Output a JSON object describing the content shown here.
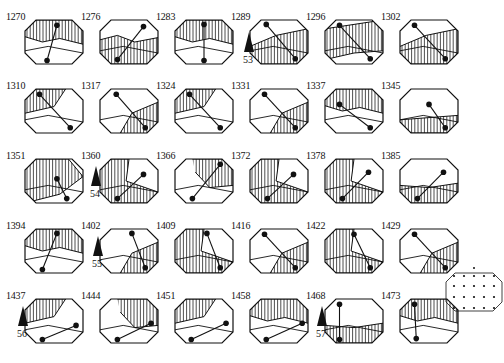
{
  "figure": {
    "frames": [
      {
        "label": "1270",
        "row": 0,
        "col": 0,
        "pattern": "top-band",
        "dot_a": [
          0.55,
          0.12
        ],
        "dot_b": [
          0.38,
          0.92
        ]
      },
      {
        "label": "1276",
        "row": 0,
        "col": 1,
        "pattern": "bottom-wave",
        "dot_a": [
          0.75,
          0.15
        ],
        "dot_b": [
          0.3,
          0.9
        ]
      },
      {
        "label": "1283",
        "row": 0,
        "col": 2,
        "pattern": "top-band",
        "dot_a": [
          0.5,
          0.1
        ],
        "dot_b": [
          0.5,
          0.92
        ]
      },
      {
        "label": "1289",
        "row": 0,
        "col": 3,
        "pattern": "diag-lower",
        "dot_a": [
          0.28,
          0.1
        ],
        "dot_b": [
          0.78,
          0.88
        ]
      },
      {
        "label": "1296",
        "row": 0,
        "col": 4,
        "pattern": "full-wave",
        "dot_a": [
          0.25,
          0.12
        ],
        "dot_b": [
          0.78,
          0.88
        ]
      },
      {
        "label": "1302",
        "row": 0,
        "col": 5,
        "pattern": "diag-lower",
        "dot_a": [
          0.25,
          0.12
        ],
        "dot_b": [
          0.78,
          0.88
        ]
      },
      {
        "label": "1310",
        "row": 1,
        "col": 0,
        "pattern": "top-left",
        "dot_a": [
          0.25,
          0.12
        ],
        "dot_b": [
          0.78,
          0.88
        ]
      },
      {
        "label": "1317",
        "row": 1,
        "col": 1,
        "pattern": "bottom-right",
        "dot_a": [
          0.28,
          0.12
        ],
        "dot_b": [
          0.78,
          0.88
        ]
      },
      {
        "label": "1324",
        "row": 1,
        "col": 2,
        "pattern": "top-left",
        "dot_a": [
          0.25,
          0.12
        ],
        "dot_b": [
          0.78,
          0.88
        ]
      },
      {
        "label": "1331",
        "row": 1,
        "col": 3,
        "pattern": "bottom-right",
        "dot_a": [
          0.25,
          0.12
        ],
        "dot_b": [
          0.78,
          0.88
        ]
      },
      {
        "label": "1337",
        "row": 1,
        "col": 4,
        "pattern": "top-band",
        "dot_a": [
          0.25,
          0.35
        ],
        "dot_b": [
          0.78,
          0.88
        ]
      },
      {
        "label": "1345",
        "row": 1,
        "col": 5,
        "pattern": "ring-bottom",
        "dot_a": [
          0.5,
          0.35
        ],
        "dot_b": [
          0.78,
          0.88
        ]
      },
      {
        "label": "1351",
        "row": 2,
        "col": 0,
        "pattern": "ring",
        "dot_a": [
          0.55,
          0.45
        ],
        "dot_b": [
          0.72,
          0.9
        ]
      },
      {
        "label": "1360",
        "row": 2,
        "col": 1,
        "pattern": "left",
        "dot_a": [
          0.75,
          0.35
        ],
        "dot_b": [
          0.3,
          0.9
        ]
      },
      {
        "label": "1366",
        "row": 2,
        "col": 2,
        "pattern": "top-right",
        "dot_a": [
          0.78,
          0.12
        ],
        "dot_b": [
          0.3,
          0.9
        ]
      },
      {
        "label": "1372",
        "row": 2,
        "col": 3,
        "pattern": "left",
        "dot_a": [
          0.75,
          0.35
        ],
        "dot_b": [
          0.3,
          0.9
        ]
      },
      {
        "label": "1378",
        "row": 2,
        "col": 4,
        "pattern": "left",
        "dot_a": [
          0.75,
          0.3
        ],
        "dot_b": [
          0.3,
          0.9
        ]
      },
      {
        "label": "1385",
        "row": 2,
        "col": 5,
        "pattern": "bottom-band",
        "dot_a": [
          0.75,
          0.3
        ],
        "dot_b": [
          0.3,
          0.9
        ]
      },
      {
        "label": "1394",
        "row": 3,
        "col": 0,
        "pattern": "top-band",
        "dot_a": [
          0.55,
          0.1
        ],
        "dot_b": [
          0.3,
          0.92
        ]
      },
      {
        "label": "1402",
        "row": 3,
        "col": 1,
        "pattern": "bottom-right",
        "dot_a": [
          0.55,
          0.1
        ],
        "dot_b": [
          0.78,
          0.88
        ]
      },
      {
        "label": "1409",
        "row": 3,
        "col": 2,
        "pattern": "left",
        "dot_a": [
          0.55,
          0.1
        ],
        "dot_b": [
          0.78,
          0.88
        ]
      },
      {
        "label": "1416",
        "row": 3,
        "col": 3,
        "pattern": "bottom-right",
        "dot_a": [
          0.25,
          0.12
        ],
        "dot_b": [
          0.78,
          0.88
        ]
      },
      {
        "label": "1422",
        "row": 3,
        "col": 4,
        "pattern": "left",
        "dot_a": [
          0.5,
          0.12
        ],
        "dot_b": [
          0.78,
          0.88
        ]
      },
      {
        "label": "1429",
        "row": 3,
        "col": 5,
        "pattern": "bottom-right",
        "dot_a": [
          0.25,
          0.12
        ],
        "dot_b": [
          0.78,
          0.88
        ]
      },
      {
        "label": "1437",
        "row": 4,
        "col": 0,
        "pattern": "top-left",
        "dot_a": [
          0.88,
          0.6
        ],
        "dot_b": [
          0.3,
          0.92
        ]
      },
      {
        "label": "1444",
        "row": 4,
        "col": 1,
        "pattern": "top-right",
        "dot_a": [
          0.88,
          0.55
        ],
        "dot_b": [
          0.3,
          0.92
        ]
      },
      {
        "label": "1451",
        "row": 4,
        "col": 2,
        "pattern": "top-left",
        "dot_a": [
          0.88,
          0.55
        ],
        "dot_b": [
          0.28,
          0.92
        ]
      },
      {
        "label": "1458",
        "row": 4,
        "col": 3,
        "pattern": "top-band",
        "dot_a": [
          0.9,
          0.55
        ],
        "dot_b": [
          0.28,
          0.92
        ]
      },
      {
        "label": "1468",
        "row": 4,
        "col": 4,
        "pattern": "bottom-band",
        "dot_a": [
          0.25,
          0.12
        ],
        "dot_b": [
          0.25,
          0.92
        ]
      },
      {
        "label": "1473",
        "row": 4,
        "col": 5,
        "pattern": "top-band",
        "dot_a": [
          0.25,
          0.12
        ],
        "dot_b": [
          0.28,
          0.9
        ]
      }
    ],
    "markers": [
      {
        "num": "53",
        "x": 243,
        "y": 32
      },
      {
        "num": "54",
        "x": 90,
        "y": 166
      },
      {
        "num": "55",
        "x": 92,
        "y": 236
      },
      {
        "num": "56",
        "x": 17,
        "y": 306
      },
      {
        "num": "57",
        "x": 316,
        "y": 306
      }
    ],
    "legend": {
      "name": "electrode-grid",
      "rows": 4,
      "cols": 5
    }
  }
}
